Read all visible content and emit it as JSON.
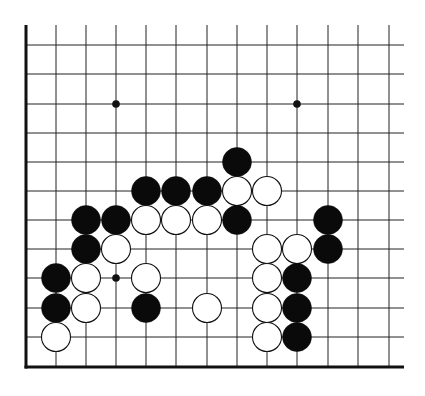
{
  "diagram": {
    "type": "go-board-partial",
    "background": "#ffffff",
    "line_color": "#222222",
    "edge_color": "#111111",
    "black_stone_color": "#0a0a0a",
    "white_stone_fill": "#ffffff",
    "white_stone_stroke": "#111111",
    "columns_x": [
      26,
      56,
      86,
      116,
      146,
      176,
      207,
      237,
      267,
      297,
      328,
      358,
      389
    ],
    "rows_y": [
      45,
      74,
      104,
      133,
      162,
      191,
      220,
      249,
      278,
      308,
      337
    ],
    "top_y": 25,
    "bottom_edge_y": 367,
    "left_edge_x": 26,
    "right_line_end_x": 404,
    "star_points": [
      {
        "x": 116,
        "y": 104
      },
      {
        "x": 297,
        "y": 104
      },
      {
        "x": 116,
        "y": 278
      }
    ],
    "stone_radius": 14.5,
    "stones": [
      {
        "color": "black",
        "x": 237,
        "y": 162
      },
      {
        "color": "black",
        "x": 146,
        "y": 191
      },
      {
        "color": "black",
        "x": 176,
        "y": 191
      },
      {
        "color": "black",
        "x": 207,
        "y": 191
      },
      {
        "color": "white",
        "x": 237,
        "y": 191
      },
      {
        "color": "white",
        "x": 267,
        "y": 191
      },
      {
        "color": "black",
        "x": 86,
        "y": 220
      },
      {
        "color": "black",
        "x": 116,
        "y": 220
      },
      {
        "color": "white",
        "x": 146,
        "y": 220
      },
      {
        "color": "white",
        "x": 176,
        "y": 220
      },
      {
        "color": "white",
        "x": 207,
        "y": 220
      },
      {
        "color": "black",
        "x": 237,
        "y": 220
      },
      {
        "color": "black",
        "x": 328,
        "y": 220
      },
      {
        "color": "black",
        "x": 86,
        "y": 249
      },
      {
        "color": "white",
        "x": 116,
        "y": 249
      },
      {
        "color": "white",
        "x": 267,
        "y": 249
      },
      {
        "color": "white",
        "x": 297,
        "y": 249
      },
      {
        "color": "black",
        "x": 328,
        "y": 249
      },
      {
        "color": "black",
        "x": 56,
        "y": 278
      },
      {
        "color": "white",
        "x": 86,
        "y": 278
      },
      {
        "color": "white",
        "x": 146,
        "y": 278
      },
      {
        "color": "white",
        "x": 267,
        "y": 278
      },
      {
        "color": "black",
        "x": 297,
        "y": 278
      },
      {
        "color": "black",
        "x": 56,
        "y": 308
      },
      {
        "color": "white",
        "x": 86,
        "y": 308
      },
      {
        "color": "black",
        "x": 146,
        "y": 308
      },
      {
        "color": "white",
        "x": 207,
        "y": 308
      },
      {
        "color": "white",
        "x": 267,
        "y": 308
      },
      {
        "color": "black",
        "x": 297,
        "y": 308
      },
      {
        "color": "white",
        "x": 56,
        "y": 337
      },
      {
        "color": "white",
        "x": 267,
        "y": 337
      },
      {
        "color": "black",
        "x": 297,
        "y": 337
      }
    ]
  }
}
